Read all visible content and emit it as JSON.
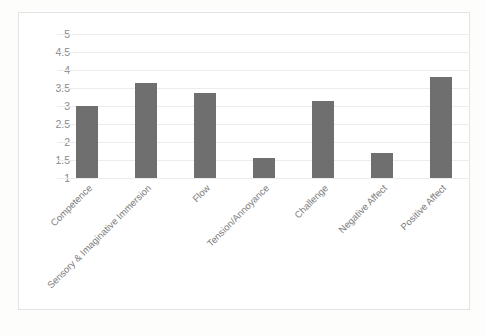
{
  "chart_data": {
    "type": "bar",
    "title": "",
    "xlabel": "",
    "ylabel": "",
    "categories": [
      "Competence",
      "Sensory & Imaginative Immersion",
      "Flow",
      "Tension/Annoyance",
      "Challenge",
      "Negative Affect",
      "Positive Affect"
    ],
    "values": [
      3.0,
      3.65,
      3.35,
      1.55,
      3.15,
      1.7,
      3.8
    ],
    "ylim": [
      1,
      5
    ],
    "yticks": [
      1,
      1.5,
      2,
      2.5,
      3,
      3.5,
      4,
      4.5,
      5
    ],
    "ytick_labels": [
      "1",
      "1.5",
      "2",
      "2.5",
      "3",
      "3.5",
      "4",
      "4.5",
      "5"
    ],
    "grid": true,
    "legend": "none",
    "series": [
      {
        "name": "Mean score",
        "values": [
          3.0,
          3.65,
          3.35,
          1.55,
          3.15,
          1.7,
          3.8
        ]
      }
    ],
    "colors": {
      "bar": "#6f6f6f",
      "gridline": "#ececec",
      "frame_border": "#e3e3e3",
      "tick_text": "#8a8a8a",
      "category_text": "#7d7d7d",
      "plot_background": "#ffffff",
      "page_background": "#fdfdfc"
    }
  }
}
